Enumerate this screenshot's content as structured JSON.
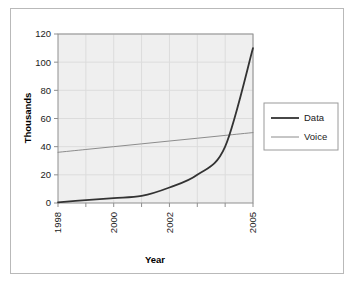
{
  "chart_data": {
    "type": "line",
    "title": "",
    "xlabel": "Year",
    "ylabel": "Thousands",
    "xlim": [
      1998,
      2005
    ],
    "ylim": [
      0,
      120
    ],
    "grid": true,
    "legend_position": "right",
    "x": [
      1998,
      1999,
      2000,
      2001,
      2002,
      2003,
      2004,
      2005
    ],
    "xtick_labels": [
      "1998",
      "2000",
      "2002",
      "2005"
    ],
    "xtick_values": [
      1998,
      2000,
      2002,
      2005
    ],
    "ytick_labels": [
      "0",
      "20",
      "40",
      "60",
      "80",
      "100",
      "120"
    ],
    "ytick_values": [
      0,
      20,
      40,
      60,
      80,
      100,
      120
    ],
    "series": [
      {
        "name": "Data",
        "color": "#333333",
        "width": 1.8,
        "values": [
          0.5,
          2,
          3.5,
          5,
          11,
          20,
          40,
          110
        ]
      },
      {
        "name": "Voice",
        "color": "#8c8c8c",
        "width": 1.0,
        "values": [
          36,
          38,
          40,
          42,
          44,
          46,
          48,
          50
        ]
      }
    ]
  },
  "axes": {
    "y_title": "Thousands",
    "x_title": "Year",
    "y_ticks": [
      "120",
      "100",
      "80",
      "60",
      "40",
      "20",
      "0"
    ],
    "x_ticks": [
      "1998",
      "2000",
      "2002",
      "2005"
    ]
  },
  "legend": {
    "items": [
      {
        "label": "Data",
        "color": "#333333"
      },
      {
        "label": "Voice",
        "color": "#8c8c8c"
      }
    ]
  },
  "colors": {
    "plot_background": "#efefef",
    "grid": "#dcdcdc",
    "axis": "#8f8f8f",
    "frame": "#b9b9b9",
    "data_series": "#333333",
    "voice_series": "#8c8c8c"
  }
}
